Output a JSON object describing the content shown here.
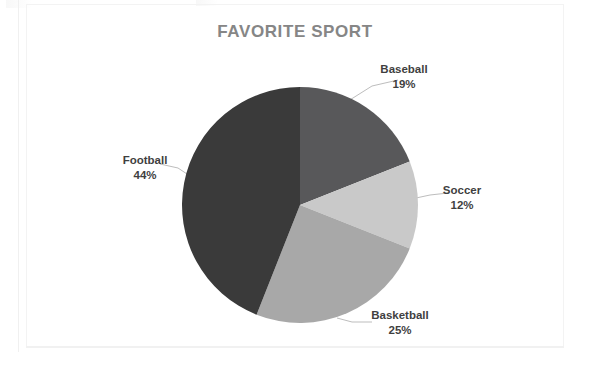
{
  "chart_data": {
    "type": "pie",
    "title": "FAVORITE SPORT",
    "categories": [
      "Baseball",
      "Soccer",
      "Basketball",
      "Football"
    ],
    "values": [
      19,
      12,
      25,
      44
    ],
    "value_suffix": "%",
    "unit": "percent",
    "total": 100,
    "start_angle_deg": 0,
    "direction": "clockwise",
    "legend": "none",
    "labels_position": "outside-with-leader-lines",
    "grid": false,
    "slices": [
      {
        "label": "Baseball",
        "value": 19,
        "value_text": "19%",
        "color": "#58585a",
        "start_deg": 0,
        "end_deg": 68.4
      },
      {
        "label": "Soccer",
        "value": 12,
        "value_text": "12%",
        "color": "#c9c9c9",
        "start_deg": 68.4,
        "end_deg": 111.6
      },
      {
        "label": "Basketball",
        "value": 25,
        "value_text": "25%",
        "color": "#a8a8a8",
        "start_deg": 111.6,
        "end_deg": 201.6
      },
      {
        "label": "Football",
        "value": 44,
        "value_text": "44%",
        "color": "#3a3a3a",
        "start_deg": 201.6,
        "end_deg": 360
      }
    ],
    "colors": {
      "baseball": "#58585a",
      "soccer": "#c9c9c9",
      "basketball": "#a8a8a8",
      "football": "#3a3a3a",
      "title": "#868686",
      "label_text": "#3f3f3f",
      "leader_line": "#b9b9b9",
      "background": "#ffffff"
    },
    "geometry": {
      "center_x": 300,
      "center_y": 205,
      "radius": 118
    }
  }
}
